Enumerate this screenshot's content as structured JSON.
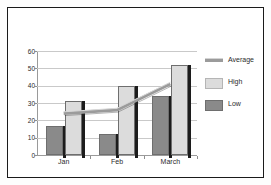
{
  "chart_data": {
    "type": "bar",
    "title": "",
    "xlabel": "",
    "ylabel": "",
    "categories": [
      "Jan",
      "Feb",
      "March"
    ],
    "series": [
      {
        "name": "Average",
        "type": "line",
        "color": "#9b9b9b",
        "values": [
          24,
          26,
          41
        ]
      },
      {
        "name": "High",
        "type": "bar",
        "color": "#dcdcdc",
        "values": [
          31,
          40,
          52
        ]
      },
      {
        "name": "Low",
        "type": "bar",
        "color": "#8a8a8a",
        "values": [
          17,
          12,
          34
        ]
      }
    ],
    "ylim": [
      0,
      60
    ],
    "yticks": [
      0,
      10,
      20,
      30,
      40,
      50,
      60
    ],
    "ytick_labels": [
      "0",
      "10",
      "20",
      "30",
      "40",
      "50",
      "60"
    ],
    "grid": true,
    "legend_position": "right"
  },
  "legend": {
    "items": [
      {
        "label": "Average",
        "swatch": "line-swatch"
      },
      {
        "label": "High",
        "swatch": "high-swatch"
      },
      {
        "label": "Low",
        "swatch": "low-swatch"
      }
    ]
  },
  "colors": {
    "border": "#1a1a1a",
    "grid": "#c9c9c9",
    "axis": "#9a9a9a",
    "background": "#ffffff",
    "high": "#dcdcdc",
    "low": "#8a8a8a",
    "average": "#9b9b9b",
    "shadow": "#1c1c1c"
  }
}
